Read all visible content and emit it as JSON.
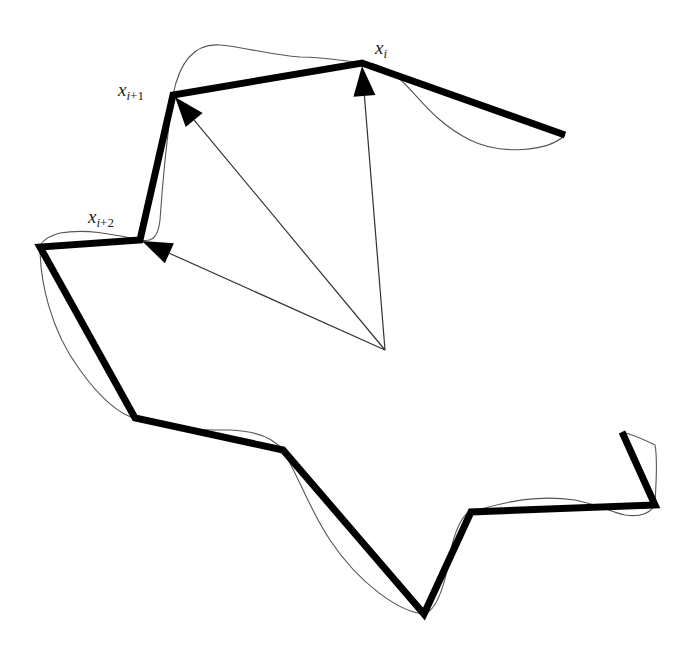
{
  "diagram": {
    "colors": {
      "background": "#ffffff",
      "polyline": "#000000",
      "curve": "#555555",
      "vector": "#333333",
      "label": "#222222"
    },
    "labels": [
      {
        "id": "xi",
        "base": "x",
        "sub_var": "i",
        "sub_rest": "",
        "x": 375,
        "y": 40
      },
      {
        "id": "xi1",
        "base": "x",
        "sub_var": "i",
        "sub_rest": "+1",
        "x": 120,
        "y": 83
      },
      {
        "id": "xi2",
        "base": "x",
        "sub_var": "i",
        "sub_rest": "+2",
        "x": 90,
        "y": 210
      }
    ],
    "polyline_vertices": [
      [
        565,
        135
      ],
      [
        362,
        63
      ],
      [
        173,
        95
      ],
      [
        140,
        240
      ],
      [
        40,
        247
      ],
      [
        135,
        418
      ],
      [
        283,
        450
      ],
      [
        424,
        614
      ],
      [
        471,
        512
      ],
      [
        655,
        505
      ],
      [
        622,
        432
      ]
    ],
    "vector_origin": [
      385,
      350
    ],
    "vectors": [
      {
        "target": "xi",
        "tip": [
          362,
          66
        ]
      },
      {
        "target": "xi1",
        "tip": [
          175,
          97
        ]
      },
      {
        "target": "xi2",
        "tip": [
          142,
          241
        ]
      }
    ],
    "curve_path": "M565,135 C548,152 500,155 470,140 C430,120 415,90 395,75 C380,64 370,62 362,63 C340,60 320,57 300,57 C270,55 250,48 220,45 C195,43 180,60 173,95 C168,130 163,175 160,220 C158,240 150,242 140,240 C120,236 90,228 60,233 C45,237 40,244 40,247 C40,280 50,330 80,370 C100,398 120,415 135,418 C170,430 200,430 230,430 C260,431 275,440 283,450 C300,480 310,510 330,540 C360,585 400,612 424,614 C440,610 448,570 452,545 C457,525 465,512 471,512 C510,500 540,495 575,500 C600,505 610,512 625,515 C645,518 652,510 655,505 C656,480 658,460 655,445 C645,440 635,435 622,432"
  }
}
